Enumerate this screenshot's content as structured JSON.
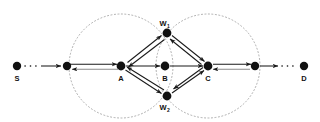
{
  "figure": {
    "type": "network-graph-diagram",
    "background": "#ffffff",
    "line_color": "#1a1a1a",
    "node_color": "#111111",
    "circle_color": "#9a9a9a"
  },
  "nodes": [
    {
      "id": "S",
      "label": "S",
      "x": 17,
      "y": 66,
      "r": 4.2,
      "label_pos": "below",
      "label_dx": 0,
      "label_dy": 12,
      "sub": ""
    },
    {
      "id": "n1",
      "label": "",
      "x": 67,
      "y": 66,
      "r": 4.2,
      "label_pos": "none",
      "label_dx": 0,
      "label_dy": 0,
      "sub": ""
    },
    {
      "id": "A",
      "label": "A",
      "x": 121,
      "y": 66,
      "r": 4.4,
      "label_pos": "below",
      "label_dx": 0,
      "label_dy": 12,
      "sub": ""
    },
    {
      "id": "B",
      "label": "B",
      "x": 165,
      "y": 66,
      "r": 4.4,
      "label_pos": "below",
      "label_dx": 0,
      "label_dy": 12,
      "sub": ""
    },
    {
      "id": "C",
      "label": "C",
      "x": 208,
      "y": 66,
      "r": 4.4,
      "label_pos": "below",
      "label_dx": 0,
      "label_dy": 12,
      "sub": ""
    },
    {
      "id": "n2",
      "label": "",
      "x": 255,
      "y": 66,
      "r": 4.2,
      "label_pos": "none",
      "label_dx": 0,
      "label_dy": 0,
      "sub": ""
    },
    {
      "id": "D",
      "label": "D",
      "x": 304,
      "y": 66,
      "r": 4.2,
      "label_pos": "below",
      "label_dx": 0,
      "label_dy": 12,
      "sub": ""
    },
    {
      "id": "W1",
      "label": "W",
      "x": 167,
      "y": 33,
      "r": 4.4,
      "label_pos": "above",
      "label_dx": 0,
      "label_dy": -7,
      "sub": "1"
    },
    {
      "id": "W2",
      "label": "W",
      "x": 167,
      "y": 96,
      "r": 4.4,
      "label_pos": "below",
      "label_dx": 0,
      "label_dy": 12,
      "sub": "2"
    }
  ],
  "circles": [
    {
      "name": "coverage-circle-a",
      "cx": 121,
      "cy": 66,
      "r": 52
    },
    {
      "name": "coverage-circle-c",
      "cx": 208,
      "cy": 66,
      "r": 52
    }
  ],
  "edges": [
    {
      "name": "edge-s-n1",
      "from": "S",
      "to": "n1",
      "style": "dotted-then-arrow",
      "direction": "forward"
    },
    {
      "name": "edge-n1-a",
      "from": "n1",
      "to": "A",
      "style": "double",
      "direction": "both"
    },
    {
      "name": "edge-a-b",
      "from": "A",
      "to": "B",
      "style": "single",
      "direction": "forward"
    },
    {
      "name": "edge-b-c",
      "from": "B",
      "to": "C",
      "style": "single",
      "direction": "forward"
    },
    {
      "name": "edge-c-n2",
      "from": "C",
      "to": "n2",
      "style": "double",
      "direction": "both"
    },
    {
      "name": "edge-n2-d",
      "from": "n2",
      "to": "D",
      "style": "arrow-then-dotted",
      "direction": "forward"
    },
    {
      "name": "edge-a-w1",
      "from": "A",
      "to": "W1",
      "style": "double",
      "direction": "both"
    },
    {
      "name": "edge-w1-c",
      "from": "W1",
      "to": "C",
      "style": "double",
      "direction": "both"
    },
    {
      "name": "edge-a-w2",
      "from": "A",
      "to": "W2",
      "style": "double",
      "direction": "both"
    },
    {
      "name": "edge-w2-c",
      "from": "W2",
      "to": "C",
      "style": "double",
      "direction": "both"
    }
  ],
  "labels": {
    "s": "S",
    "a": "A",
    "b": "B",
    "c": "C",
    "d": "D",
    "w1_base": "W",
    "w1_sub": "1",
    "w2_base": "W",
    "w2_sub": "2"
  }
}
